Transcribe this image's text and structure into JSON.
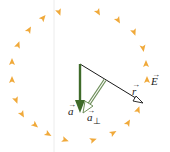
{
  "diagram": {
    "title": "",
    "colors": {
      "field_arrow": "#f0a93a",
      "acceleration": "#3f6b2a",
      "perpendicular_component": "#6e8f5a",
      "radius_line": "#1a1a1a",
      "guide_line": "#e6e6e6"
    },
    "labels": {
      "a": "a",
      "a_perp": "a",
      "a_perp_sub": "⊥",
      "r": "r",
      "E": "E",
      "vec_mark": "→"
    },
    "field_arrows": [
      {
        "x": 59,
        "y": 12,
        "angle": 160
      },
      {
        "x": 98,
        "y": 12,
        "angle": 150
      },
      {
        "x": 118,
        "y": 20,
        "angle": 150
      },
      {
        "x": 134,
        "y": 32,
        "angle": 160
      },
      {
        "x": 143,
        "y": 48,
        "angle": 170
      },
      {
        "x": 146,
        "y": 64,
        "angle": 0
      },
      {
        "x": 147,
        "y": 80,
        "angle": 0
      },
      {
        "x": 138,
        "y": 110,
        "angle": 20
      },
      {
        "x": 128,
        "y": 123,
        "angle": 30
      },
      {
        "x": 113,
        "y": 133,
        "angle": 60
      },
      {
        "x": 93,
        "y": 140,
        "angle": 70
      },
      {
        "x": 65,
        "y": 140,
        "angle": 110
      },
      {
        "x": 48,
        "y": 134,
        "angle": 120
      },
      {
        "x": 35,
        "y": 125,
        "angle": 130
      },
      {
        "x": 22,
        "y": 114,
        "angle": 150
      },
      {
        "x": 16,
        "y": 100,
        "angle": 160
      },
      {
        "x": 12,
        "y": 80,
        "angle": 0
      },
      {
        "x": 12,
        "y": 62,
        "angle": 0
      },
      {
        "x": 18,
        "y": 45,
        "angle": 20
      },
      {
        "x": 29,
        "y": 30,
        "angle": 30
      },
      {
        "x": 43,
        "y": 18,
        "angle": 40
      }
    ]
  }
}
